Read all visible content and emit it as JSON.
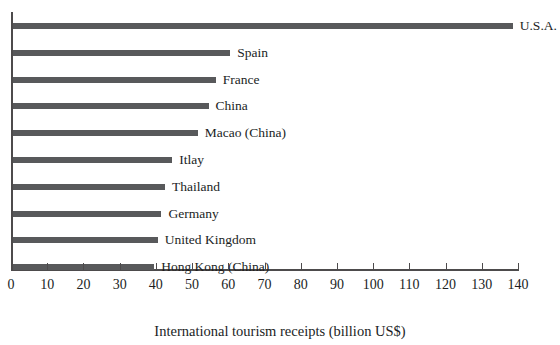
{
  "chart_data": {
    "type": "bar",
    "orientation": "horizontal",
    "title": "",
    "xlabel": "International tourism receipts (billion US$)",
    "ylabel": "",
    "xlim": [
      0,
      140
    ],
    "xticks": [
      "0",
      "10",
      "20",
      "30",
      "40",
      "50",
      "60",
      "70",
      "80",
      "90",
      "100",
      "110",
      "120",
      "130",
      "140"
    ],
    "xtick_values": [
      0,
      10,
      20,
      30,
      40,
      50,
      60,
      70,
      80,
      90,
      100,
      110,
      120,
      130,
      140
    ],
    "grid": false,
    "legend": false,
    "bar_color": "#58595b",
    "axis_color": "#4d4b4c",
    "categories": [
      "U.S.A.",
      "Spain",
      "France",
      "China",
      "Macao (China)",
      "Itlay",
      "Thailand",
      "Germany",
      "United Kingdom",
      "Hong Kong (China)"
    ],
    "values": [
      138,
      60,
      56,
      54,
      51,
      44,
      42,
      41,
      40,
      39
    ],
    "bars": [
      {
        "label": "U.S.A.",
        "value": 138
      },
      {
        "label": "Spain",
        "value": 60
      },
      {
        "label": "France",
        "value": 56
      },
      {
        "label": "China",
        "value": 54
      },
      {
        "label": "Macao (China)",
        "value": 51
      },
      {
        "label": "Itlay",
        "value": 44
      },
      {
        "label": "Thailand",
        "value": 42
      },
      {
        "label": "Germany",
        "value": 41
      },
      {
        "label": "United Kingdom",
        "value": 40
      },
      {
        "label": "Hong Kong (China)",
        "value": 39
      }
    ]
  }
}
